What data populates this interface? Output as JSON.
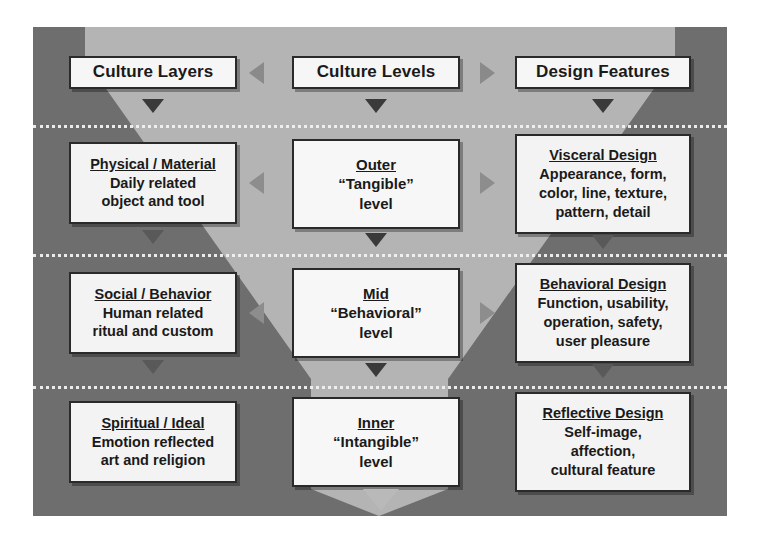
{
  "diagram": {
    "colors": {
      "background_dark": "#6e6e6e",
      "funnel_light": "#b4b4b4",
      "box_fill": "#f3f3f3",
      "box_border": "#2a2a2a",
      "divider": "#f2f2f2"
    },
    "headers": {
      "left": "Culture Layers",
      "center": "Culture Levels",
      "right": "Design Features"
    },
    "rows": [
      {
        "left": {
          "title": "Physical / Material",
          "lines": [
            "Daily related",
            "object and tool"
          ]
        },
        "center": {
          "title": "Outer",
          "lines": [
            "“Tangible”",
            "level"
          ]
        },
        "right": {
          "title": "Visceral Design",
          "lines": [
            "Appearance, form,",
            "color, line, texture,",
            "pattern, detail"
          ]
        }
      },
      {
        "left": {
          "title": "Social / Behavior",
          "lines": [
            "Human related",
            "ritual and custom"
          ]
        },
        "center": {
          "title": "Mid",
          "lines": [
            "“Behavioral”",
            "level"
          ]
        },
        "right": {
          "title": "Behavioral Design",
          "lines": [
            "Function, usability,",
            "operation, safety,",
            "user pleasure"
          ]
        }
      },
      {
        "left": {
          "title": "Spiritual / Ideal",
          "lines": [
            "Emotion reflected",
            "art and religion"
          ]
        },
        "center": {
          "title": "Inner",
          "lines": [
            "“Intangible”",
            "level"
          ]
        },
        "right": {
          "title": "Reflective Design",
          "lines": [
            "Self-image,",
            "affection,",
            "cultural feature"
          ]
        }
      }
    ],
    "icons": {
      "down_arrow": "triangle-down-icon",
      "left_arrow": "triangle-left-icon",
      "right_arrow": "triangle-right-icon"
    }
  }
}
